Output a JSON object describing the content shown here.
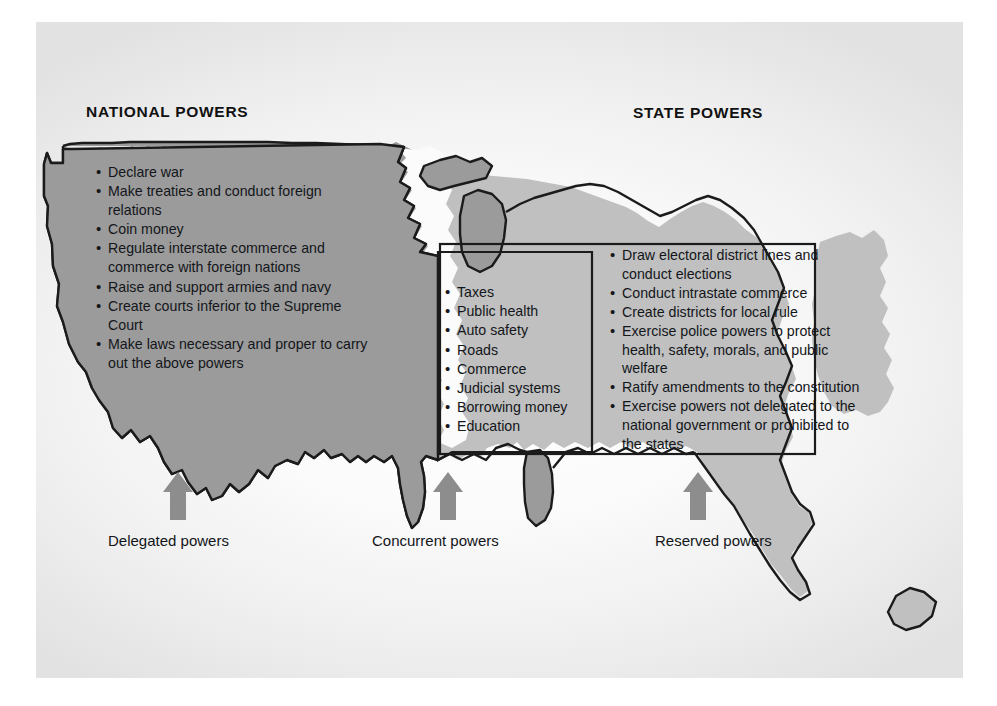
{
  "figure": {
    "colors": {
      "national_fill": "#9b9b9b",
      "state_fill": "#c0c0c0",
      "map_outline": "#1b1b1b",
      "arrow_fill": "#8d8d8d",
      "text": "#13161a",
      "page_background": "#f4f4f4"
    }
  },
  "headings": {
    "national": "NATIONAL POWERS",
    "state": "STATE POWERS"
  },
  "national_powers": [
    "Declare war",
    "Make treaties and conduct foreign relations",
    "Coin money",
    "Regulate interstate commerce and commerce with foreign nations",
    "Raise and support armies and navy",
    "Create courts inferior to the Supreme Court",
    "Make laws necessary and proper to carry out the above powers"
  ],
  "concurrent_powers": [
    "Taxes",
    "Public health",
    "Auto safety",
    "Roads",
    "Commerce",
    "Judicial systems",
    "Borrowing money",
    "Education"
  ],
  "state_powers": [
    "Draw electoral district lines and conduct  elections",
    "Conduct intrastate commerce",
    "Create districts for local rule",
    "Exercise police powers to protect health, safety, morals, and public welfare",
    "Ratify amendments to the constitution",
    "Exercise powers not delegated to the national government or prohibited to the states"
  ],
  "captions": {
    "delegated": "Delegated powers",
    "concurrent": "Concurrent powers",
    "reserved": "Reserved powers"
  }
}
